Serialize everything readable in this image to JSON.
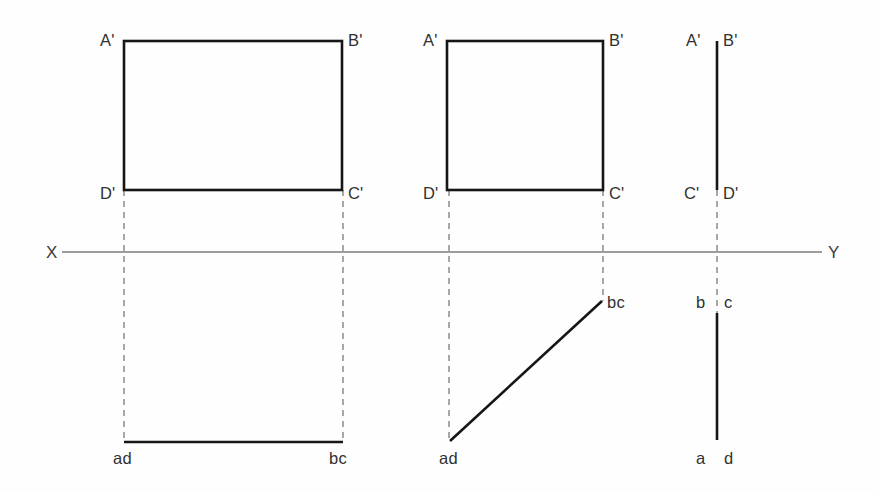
{
  "figure": {
    "background_color": "#fefefe",
    "line_color": "#161616",
    "projector_color": "#8a8a8a",
    "axis_color": "#7d7d7d",
    "label_color": "#303030"
  },
  "axis": {
    "left_label": "X",
    "right_label": "Y",
    "y": 252,
    "x_start": 62,
    "x_end": 822,
    "left_label_x": 46,
    "right_label_x": 828,
    "label_y": 258
  },
  "views": [
    {
      "id": "view-1",
      "name": "first-view",
      "front_view": {
        "type": "rectangle",
        "x1": 124,
        "y1": 41,
        "x2": 342,
        "y2": 190,
        "labels": [
          {
            "text": "A'",
            "x": 100,
            "y": 46,
            "name": "label-a-prime"
          },
          {
            "text": "B'",
            "x": 348,
            "y": 46,
            "name": "label-b-prime"
          },
          {
            "text": "C'",
            "x": 348,
            "y": 199,
            "name": "label-c-prime"
          },
          {
            "text": "D'",
            "x": 100,
            "y": 199,
            "name": "label-d-prime"
          }
        ]
      },
      "top_view": {
        "type": "horizontal-line",
        "x1": 124,
        "x2": 343,
        "y": 442,
        "labels": [
          {
            "text": "ad",
            "x": 113,
            "y": 464,
            "name": "label-ad"
          },
          {
            "text": "bc",
            "x": 329,
            "y": 464,
            "name": "label-bc"
          }
        ]
      },
      "projectors": [
        {
          "x": 124,
          "y1": 190,
          "y2": 442
        },
        {
          "x": 343,
          "y1": 190,
          "y2": 442
        }
      ]
    },
    {
      "id": "view-2",
      "name": "second-view",
      "front_view": {
        "type": "rectangle",
        "x1": 447,
        "y1": 41,
        "x2": 603,
        "y2": 190,
        "labels": [
          {
            "text": "A'",
            "x": 423,
            "y": 46,
            "name": "label-a-prime"
          },
          {
            "text": "B'",
            "x": 609,
            "y": 46,
            "name": "label-b-prime"
          },
          {
            "text": "C'",
            "x": 609,
            "y": 199,
            "name": "label-c-prime"
          },
          {
            "text": "D'",
            "x": 423,
            "y": 199,
            "name": "label-d-prime"
          }
        ]
      },
      "top_view": {
        "type": "diagonal-line",
        "x1": 450,
        "y1": 441,
        "x2": 602,
        "y2": 301,
        "labels": [
          {
            "text": "ad",
            "x": 439,
            "y": 464,
            "name": "label-ad"
          },
          {
            "text": "bc",
            "x": 607,
            "y": 308,
            "name": "label-bc"
          }
        ]
      },
      "projectors": [
        {
          "x": 449,
          "y1": 190,
          "y2": 441
        },
        {
          "x": 603,
          "y1": 190,
          "y2": 301
        }
      ]
    },
    {
      "id": "view-3",
      "name": "third-view",
      "front_view": {
        "type": "vertical-line",
        "x": 717,
        "y1": 41,
        "y2": 190,
        "labels": [
          {
            "text": "A'",
            "x": 686,
            "y": 46,
            "name": "label-a-prime"
          },
          {
            "text": "B'",
            "x": 723,
            "y": 46,
            "name": "label-b-prime"
          },
          {
            "text": "C'",
            "x": 684,
            "y": 199,
            "name": "label-c-prime"
          },
          {
            "text": "D'",
            "x": 723,
            "y": 199,
            "name": "label-d-prime"
          }
        ]
      },
      "top_view": {
        "type": "vertical-line",
        "x": 717,
        "y1": 313,
        "y2": 440,
        "labels": [
          {
            "text": "b",
            "x": 696,
            "y": 308,
            "name": "label-b"
          },
          {
            "text": "c",
            "x": 724,
            "y": 308,
            "name": "label-c"
          },
          {
            "text": "a",
            "x": 696,
            "y": 464,
            "name": "label-a"
          },
          {
            "text": "d",
            "x": 724,
            "y": 464,
            "name": "label-d"
          }
        ]
      },
      "projectors": [
        {
          "x": 717,
          "y1": 190,
          "y2": 313
        }
      ]
    }
  ]
}
